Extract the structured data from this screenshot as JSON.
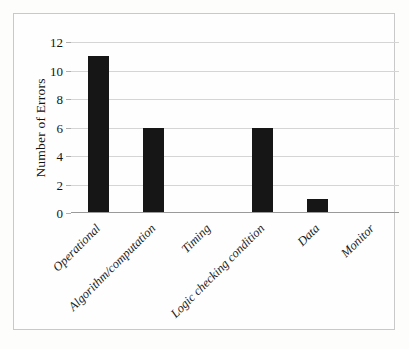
{
  "chart_data": {
    "type": "bar",
    "title": "",
    "xlabel": "",
    "ylabel": "Number of Errors",
    "categories": [
      "Operational",
      "Algorithm/computation",
      "Timing",
      "Logic checking condition",
      "Data",
      "Monitor"
    ],
    "values": [
      11,
      6,
      0,
      6,
      1,
      0
    ],
    "ylim": [
      0,
      12
    ],
    "yticks": [
      0,
      2,
      4,
      6,
      8,
      10,
      12
    ],
    "ytick_labels": [
      "0",
      "2",
      "4",
      "6",
      "8",
      "10",
      "12"
    ],
    "grid": true,
    "legend": false,
    "bar_color": "#161616",
    "gridline_color": "#d5d5d5",
    "axis_color": "#9a9a9a",
    "background_color": "#fefefe",
    "frame_color": "#c9c9c9"
  }
}
